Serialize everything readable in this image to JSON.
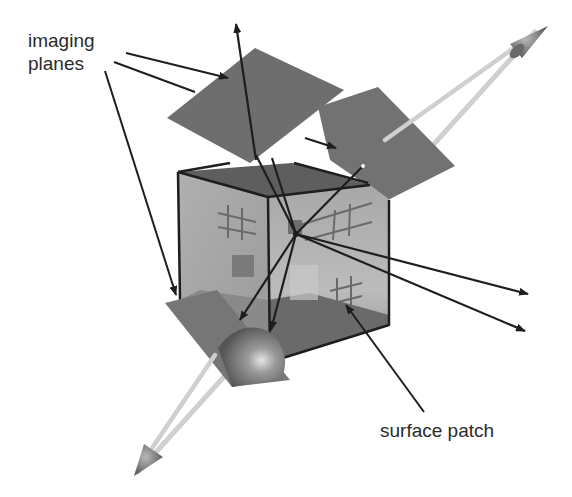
{
  "figure": {
    "labels": {
      "imaging_planes_line1": "imaging",
      "imaging_planes_line2": "planes",
      "surface_patch": "surface patch"
    },
    "colors": {
      "background": "#ffffff",
      "plane_fill": "#6e6e6e",
      "cube_top": "#5e5e5e",
      "cube_left_face": "#a9a9a9",
      "cube_right_face": "#9c9c9c",
      "cube_floor": "#6a6a6a",
      "ray": "#1e1e1e",
      "axis": "#8a8a8a",
      "text": "#2b2b2b"
    },
    "elements": [
      "imaging-plane-top-left",
      "imaging-plane-top-right",
      "imaging-plane-bottom-left",
      "cube",
      "surface-patch-grid",
      "projection-rays",
      "view-axis-arrow"
    ]
  }
}
